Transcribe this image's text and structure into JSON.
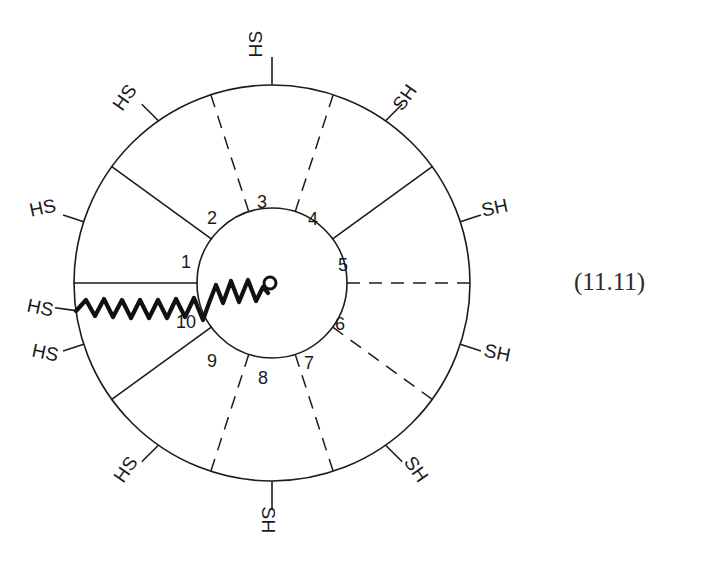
{
  "figure": {
    "equation_number": "(11.11)",
    "center": {
      "x": 272,
      "y": 283
    },
    "inner_radius": 75,
    "outer_radius": 198,
    "colors": {
      "ink": "#1c1c1c",
      "bold_ink": "#111111",
      "background": "#ffffff"
    },
    "inner_sector_numbers": [
      {
        "text": "1",
        "x": 186,
        "y": 262,
        "angle_deg": 180
      },
      {
        "text": "2",
        "x": 211,
        "y": 217,
        "angle_deg": 216
      },
      {
        "text": "3",
        "x": 262,
        "y": 200,
        "angle_deg": 252
      },
      {
        "text": "4",
        "x": 311,
        "y": 219,
        "angle_deg": 288
      },
      {
        "text": "5",
        "x": 341,
        "y": 265,
        "angle_deg": 324
      },
      {
        "text": "6",
        "x": 336,
        "y": 325,
        "angle_deg": 36
      },
      {
        "text": "7",
        "x": 306,
        "y": 364,
        "angle_deg": 72
      },
      {
        "text": "8",
        "x": 262,
        "y": 379,
        "angle_deg": 108
      },
      {
        "text": "9",
        "x": 210,
        "y": 363,
        "angle_deg": 144
      },
      {
        "text": "10",
        "x": 176,
        "y": 322,
        "angle_deg": 170
      }
    ],
    "thiol_labels": [
      {
        "text": "HS",
        "x": 262,
        "y": 44,
        "rotate": -90,
        "side": "left",
        "position": "top"
      },
      {
        "text": "SH",
        "x": 399,
        "y": 97,
        "rotate": -55,
        "side": "right",
        "position": "upper-right"
      },
      {
        "text": "SH",
        "x": 484,
        "y": 216,
        "rotate": -12,
        "side": "right",
        "position": "right-upper"
      },
      {
        "text": "SH",
        "x": 485,
        "y": 353,
        "rotate": 12,
        "side": "right",
        "position": "right-lower"
      },
      {
        "text": "SH",
        "x": 400,
        "y": 481,
        "rotate": 55,
        "side": "right",
        "position": "lower-right"
      },
      {
        "text": "SH",
        "x": 262,
        "y": 508,
        "rotate": 90,
        "side": "right",
        "position": "bottom"
      },
      {
        "text": "HS",
        "x": 136,
        "y": 476,
        "rotate": -55,
        "side": "left",
        "position": "lower-left"
      },
      {
        "text": "HS",
        "x": 48,
        "y": 366,
        "rotate": 12,
        "side": "left",
        "position": "left-lower"
      },
      {
        "text": "HS",
        "x": 48,
        "y": 314,
        "rotate": 12,
        "side": "left",
        "position": "left-mid"
      },
      {
        "text": "HS",
        "x": 47,
        "y": 215,
        "rotate": -12,
        "side": "left",
        "position": "left-upper"
      },
      {
        "text": "HS",
        "x": 129,
        "y": 99,
        "rotate": -55,
        "side": "left",
        "position": "upper-left"
      }
    ],
    "spokes": [
      {
        "index": 1,
        "angle_deg": 180,
        "style": "solid"
      },
      {
        "index": 2,
        "angle_deg": 216,
        "style": "solid"
      },
      {
        "index": 3,
        "angle_deg": 252,
        "style": "dashed"
      },
      {
        "index": 4,
        "angle_deg": 288,
        "style": "dashed"
      },
      {
        "index": 5,
        "angle_deg": 324,
        "style": "solid"
      },
      {
        "index": 6,
        "angle_deg": 0,
        "style": "dashed"
      },
      {
        "index": 7,
        "angle_deg": 36,
        "style": "dashed"
      },
      {
        "index": 8,
        "angle_deg": 72,
        "style": "dashed"
      },
      {
        "index": 9,
        "angle_deg": 108,
        "style": "dashed"
      },
      {
        "index": 10,
        "angle_deg": 144,
        "style": "solid"
      }
    ],
    "wavy_chain": {
      "description": "bold-wavy-polymer-chain",
      "end_marker": "open-circle",
      "end_marker_x": 270,
      "end_marker_y": 283
    }
  }
}
